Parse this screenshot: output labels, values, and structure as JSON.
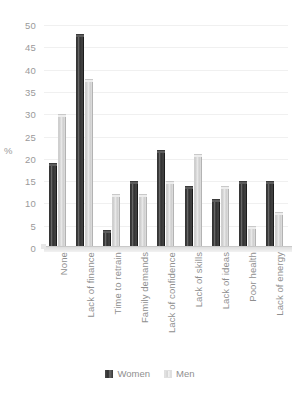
{
  "chart_data": {
    "type": "bar",
    "title": "",
    "xlabel": "",
    "ylabel": "%",
    "ylim": [
      0,
      50
    ],
    "yticks": [
      50,
      45,
      40,
      35,
      30,
      25,
      20,
      15,
      10,
      5,
      0
    ],
    "grid": true,
    "legend_position": "bottom",
    "categories": [
      "None",
      "Lack of finance",
      "Time to retrain",
      "Family demands",
      "Lack of confidence",
      "Lack of skills",
      "Lack of ideas",
      "Poor health",
      "Lack of energy"
    ],
    "series": [
      {
        "name": "Women",
        "color": "#383838",
        "values": [
          19,
          48,
          4,
          15,
          22,
          14,
          11,
          15,
          15
        ]
      },
      {
        "name": "Men",
        "color": "#dcdcdc",
        "values": [
          30,
          38,
          12,
          12,
          15,
          21,
          14,
          5,
          8
        ]
      }
    ]
  },
  "axis": {
    "y_title": "%"
  },
  "legend": {
    "items": [
      {
        "label": "Women"
      },
      {
        "label": "Men"
      }
    ]
  }
}
